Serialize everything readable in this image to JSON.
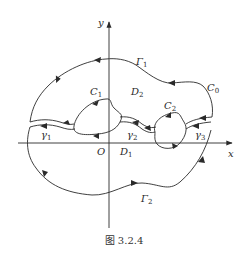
{
  "figure": {
    "caption": "图 3.2.4",
    "axes": {
      "x_label": "x",
      "y_label": "y",
      "origin_label": "O"
    },
    "outer_boundary": {
      "name": "C",
      "subscript": "0",
      "upper_arc": {
        "name": "Γ",
        "subscript": "1"
      },
      "lower_arc": {
        "name": "Γ",
        "subscript": "2"
      }
    },
    "inner_boundaries": [
      {
        "name": "C",
        "subscript": "1"
      },
      {
        "name": "C",
        "subscript": "2"
      }
    ],
    "cuts": [
      {
        "name": "γ",
        "subscript": "1"
      },
      {
        "name": "γ",
        "subscript": "2"
      },
      {
        "name": "γ",
        "subscript": "3"
      }
    ],
    "regions": [
      {
        "name": "D",
        "subscript": "1"
      },
      {
        "name": "D",
        "subscript": "2"
      }
    ],
    "colors": {
      "stroke": "#2a2a2a",
      "background": "#ffffff"
    }
  }
}
